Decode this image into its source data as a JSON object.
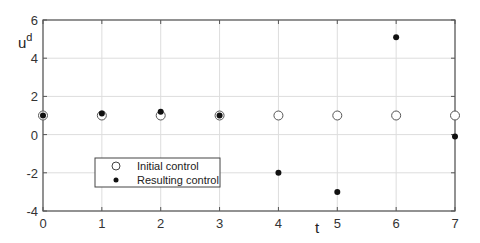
{
  "chart_data": {
    "type": "scatter",
    "title": "",
    "xlabel": "t",
    "ylabel": "u",
    "ylabel_superscript": "d",
    "xlim": [
      0,
      7
    ],
    "ylim": [
      -4,
      6
    ],
    "xticks": [
      0,
      1,
      2,
      3,
      4,
      5,
      6,
      7
    ],
    "yticks": [
      -4,
      -2,
      0,
      2,
      4,
      6
    ],
    "grid": true,
    "legend_position": "lower-left",
    "x": [
      0,
      1,
      2,
      3,
      4,
      5,
      6,
      7
    ],
    "series": [
      {
        "name": "Initial control",
        "marker": "open-circle",
        "values": [
          1,
          1,
          1,
          1,
          1,
          1,
          1,
          1
        ]
      },
      {
        "name": "Resulting control",
        "marker": "filled-dot",
        "values": [
          1.0,
          1.1,
          1.2,
          1.0,
          -2.0,
          -3.0,
          5.1,
          -0.1
        ]
      }
    ]
  },
  "colors": {
    "axis": "#555555",
    "grid": "#dddddd",
    "marker": "#111111",
    "text": "#333333"
  }
}
